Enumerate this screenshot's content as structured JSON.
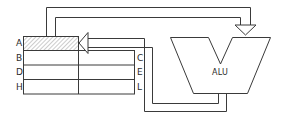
{
  "diagram": {
    "type": "register-file-alu-datapath",
    "register_file": {
      "left_labels": [
        "A",
        "B",
        "D",
        "H"
      ],
      "right_labels": [
        "C",
        "E",
        "L"
      ],
      "highlighted_register": "A"
    },
    "alu": {
      "label": "ALU"
    },
    "connections": [
      {
        "from": "A",
        "to": "ALU",
        "description": "register A feeds ALU input (top bus)"
      },
      {
        "from": "ALU",
        "to": "A",
        "description": "ALU output returns to register A"
      }
    ],
    "colors": {
      "line": "#3a3a3a",
      "hatch": "#bdbdbd",
      "background": "#ffffff"
    }
  }
}
